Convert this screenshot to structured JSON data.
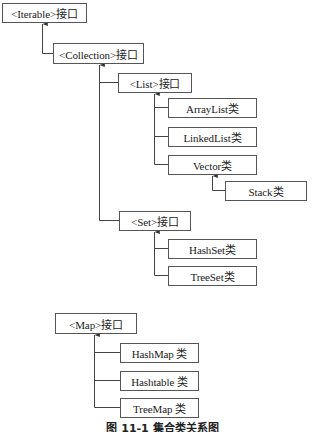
{
  "diagram": {
    "nodes": {
      "iterable": "<Iterable>接口",
      "collection": "<Collection>接口",
      "list": "<List>接口",
      "arraylist": "ArrayList类",
      "linkedlist": "LinkedList类",
      "vector": "Vector类",
      "stack": "Stack类",
      "set": "<Set>接口",
      "hashset": "HashSet类",
      "treeset": "TreeSet类",
      "map": "<Map>接口",
      "hashmap": "HashMap 类",
      "hashtable": "Hashtable 类",
      "treemap": "TreeMap 类"
    },
    "edges": [
      {
        "from": "collection",
        "to": "iterable"
      },
      {
        "from": "list",
        "to": "collection"
      },
      {
        "from": "set",
        "to": "collection"
      },
      {
        "from": "arraylist",
        "to": "list"
      },
      {
        "from": "linkedlist",
        "to": "list"
      },
      {
        "from": "vector",
        "to": "list"
      },
      {
        "from": "stack",
        "to": "vector"
      },
      {
        "from": "hashset",
        "to": "set"
      },
      {
        "from": "treeset",
        "to": "set"
      },
      {
        "from": "hashmap",
        "to": "map"
      },
      {
        "from": "hashtable",
        "to": "map"
      },
      {
        "from": "treemap",
        "to": "map"
      }
    ],
    "caption": "图 11-1   集合类关系图",
    "colors": {
      "line": "#444444",
      "border": "#555555",
      "background": "#ffffff"
    }
  }
}
